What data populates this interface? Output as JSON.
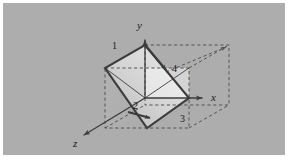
{
  "figure": {
    "background_color": "#adadad",
    "plate_border_color": "#ffffff",
    "stroke_color": "#3c3c3c",
    "dashed_color": "#5a5a5a",
    "face_fill_light": "#e8e8e8",
    "face_fill_mid": "#c4c4c4",
    "caption": ""
  },
  "axes": {
    "x": {
      "label": "x",
      "tip_x": 207,
      "tip_y": 98
    },
    "y": {
      "label": "y",
      "tip_x": 145,
      "tip_y": 36
    },
    "z": {
      "label": "z",
      "tip_x": 79,
      "tip_y": 138
    },
    "origin_x": 145,
    "origin_y": 98
  },
  "vertex_labels": [
    {
      "id": "1",
      "text": "1",
      "x": 112,
      "y": 41
    },
    {
      "id": "2",
      "text": "2",
      "x": 133,
      "y": 101
    },
    {
      "id": "3",
      "text": "3",
      "x": 180,
      "y": 118
    },
    {
      "id": "4",
      "text": "4",
      "x": 172,
      "y": 66
    }
  ],
  "cube": {
    "front_top_left_x": 105,
    "front_top_left_y": 68,
    "front_bottom_right_x": 189,
    "front_bottom_right_y": 128,
    "depth_dx": 40,
    "depth_dy": -23
  },
  "plane": {
    "name": "diagonal-cross-section",
    "vertices": [
      {
        "x": 145,
        "y": 45
      },
      {
        "x": 189,
        "y": 98
      },
      {
        "x": 147,
        "y": 128
      },
      {
        "x": 105,
        "y": 68
      }
    ]
  }
}
